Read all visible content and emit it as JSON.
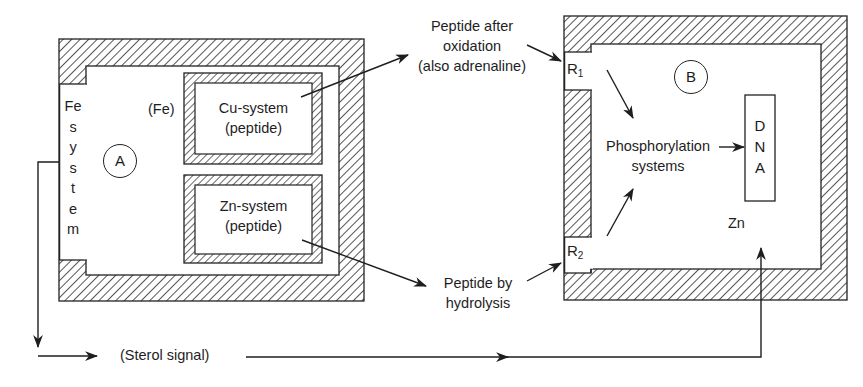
{
  "diagram": {
    "compartment_a": {
      "label": "A",
      "fe_system": {
        "label_lines": [
          "Fe",
          "s",
          "y",
          "s",
          "t",
          "e",
          "m"
        ]
      },
      "fe_note": "(Fe)",
      "cu_system": {
        "line1": "Cu-system",
        "line2": "(peptide)"
      },
      "zn_system": {
        "line1": "Zn-system",
        "line2": "(peptide)"
      }
    },
    "compartment_b": {
      "label": "B",
      "receptor_1": {
        "base": "R",
        "sub": "1"
      },
      "receptor_2": {
        "base": "R",
        "sub": "2"
      },
      "phosphorylation": {
        "line1": "Phosphorylation",
        "line2": "systems"
      },
      "dna": {
        "letters": [
          "D",
          "N",
          "A"
        ]
      },
      "zn_label": "Zn"
    },
    "signals": {
      "oxidation": {
        "line1": "Peptide after",
        "line2": "oxidation",
        "line3": "(also adrenaline)"
      },
      "hydrolysis": {
        "line1": "Peptide by",
        "line2": "hydrolysis"
      },
      "sterol": "(Sterol signal)"
    },
    "colors": {
      "ink": "#1e1e1e",
      "background": "#ffffff"
    }
  }
}
